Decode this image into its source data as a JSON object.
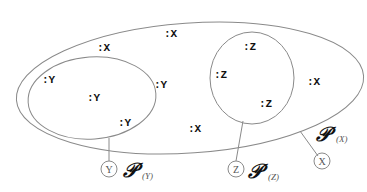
{
  "diagram": {
    "sets": {
      "x": {
        "name": "X",
        "powerset_label": "𝒫",
        "subscript": "(X)"
      },
      "y": {
        "name": "Y",
        "powerset_label": "𝒫",
        "subscript": "(Y)"
      },
      "z": {
        "name": "Z",
        "powerset_label": "𝒫",
        "subscript": "(Z)"
      }
    },
    "elements": {
      "x": [
        ":X",
        ":X",
        ":X",
        ":X"
      ],
      "y": [
        ":Y",
        ":Y",
        ":Y",
        ":Y"
      ],
      "z": [
        ":Z",
        ":Z",
        ":Z"
      ]
    },
    "nodes": {
      "x": "X",
      "y": "Y",
      "z": "Z"
    },
    "colors": {
      "outline": "#8a8a8a",
      "text": "#111111"
    }
  }
}
